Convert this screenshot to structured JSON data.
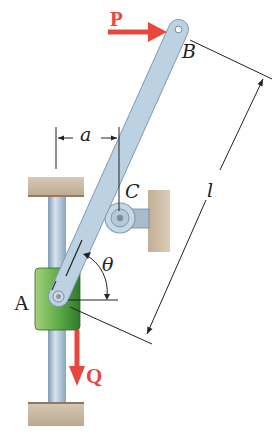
{
  "figure": {
    "labels": {
      "P": "P",
      "Q": "Q",
      "A": "A",
      "B": "B",
      "C": "C",
      "a": "a",
      "l": "l",
      "theta": "θ"
    },
    "colors": {
      "force_arrow": "#e8473f",
      "bar": "#b9cfe0",
      "bar_edge": "#7e9ab4",
      "collar": "#5aa845",
      "collar_dark": "#2f7a2a",
      "rod": "#9fb8cc",
      "support": "#c9b9a2",
      "support_edge": "#8a7a68",
      "dimension_line": "#222222"
    }
  }
}
